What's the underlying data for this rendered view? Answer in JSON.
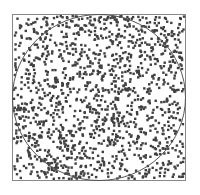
{
  "chart_data": {
    "type": "scatter",
    "title": "",
    "xlabel": "",
    "ylabel": "",
    "xlim": [
      0,
      1
    ],
    "ylim": [
      0,
      1
    ],
    "grid": false,
    "legend": "none",
    "n_points": 1400,
    "circle": {
      "cx": 0.5,
      "cy": 0.5,
      "r": 0.5
    },
    "point_color": "#404040",
    "circle_color": "#555555",
    "frame_color": "#888888",
    "seed": 12345
  },
  "caption": ""
}
